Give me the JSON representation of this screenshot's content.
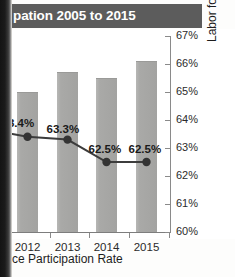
{
  "title": {
    "text": "pation 2005 to 2015"
  },
  "caption": {
    "text": "ce Participation Rate"
  },
  "colors": {
    "title_band": "#5c5c5c",
    "title_text": "#ffffff",
    "bar_fill": "#a9a9a7",
    "line": "#3c3c3c",
    "marker": "#333333",
    "axis": "#8a8a8a",
    "text": "#1d1d1d",
    "page_edge": "#141414"
  },
  "chart_data": {
    "type": "bar",
    "title": "pation 2005 to 2015",
    "categories": [
      "2012",
      "2013",
      "2014",
      "2015"
    ],
    "series": [
      {
        "name": "Bars",
        "type": "bar",
        "values": [
          65.0,
          65.7,
          65.5,
          66.1
        ],
        "axis": "right"
      },
      {
        "name": "Labor force participation rate",
        "type": "line",
        "values": [
          63.4,
          63.3,
          62.5,
          62.5
        ],
        "labels": [
          "63.4%",
          "63.3%",
          "62.5%",
          "62.5%"
        ],
        "axis": "right"
      }
    ],
    "xlabel": "",
    "ylabel": "Labor force participation rate",
    "ylim": [
      60,
      67
    ],
    "yticks": [
      60,
      61,
      62,
      63,
      64,
      65,
      66,
      67
    ],
    "ytick_labels": [
      "60%",
      "61%",
      "62%",
      "63%",
      "64%",
      "65%",
      "66%",
      "67%"
    ],
    "y_axis_position": "right",
    "grid": false,
    "legend": "none",
    "data_labels_shown": true
  },
  "axis": {
    "y_title": "Labor force participation rate",
    "ticks": [
      {
        "label": "67%",
        "value": 67
      },
      {
        "label": "66%",
        "value": 66
      },
      {
        "label": "65%",
        "value": 65
      },
      {
        "label": "64%",
        "value": 64
      },
      {
        "label": "63%",
        "value": 63
      },
      {
        "label": "62%",
        "value": 62
      },
      {
        "label": "61%",
        "value": 61
      },
      {
        "label": "60%",
        "value": 60
      }
    ],
    "x_labels": [
      "2012",
      "2013",
      "2014",
      "2015"
    ]
  }
}
